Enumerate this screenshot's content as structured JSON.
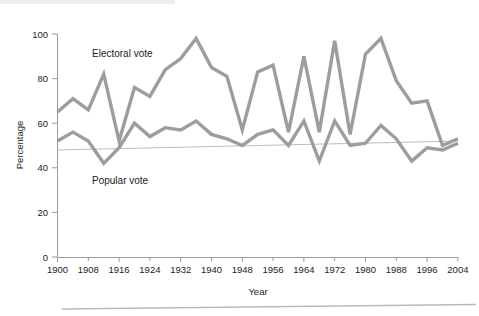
{
  "figure": {
    "background_color": "#ffffff",
    "series_color": "#9d9d9d",
    "axis_color": "#9a9a9a",
    "reference_line_color": "#b4b4b4",
    "electoral_label": "Electoral vote",
    "popular_label": "Popular vote"
  },
  "chart_data": {
    "type": "line",
    "title": "",
    "xlabel": "Year",
    "ylabel": "Percentage",
    "xlim": [
      1900,
      2004
    ],
    "ylim": [
      0,
      100
    ],
    "xticks": [
      1900,
      1908,
      1916,
      1924,
      1932,
      1940,
      1948,
      1956,
      1964,
      1972,
      1980,
      1988,
      1996,
      2004
    ],
    "xtick_labels": [
      "1900",
      "1908",
      "1916",
      "1924",
      "1932",
      "1940",
      "1948",
      "1956",
      "1964",
      "1972",
      "1980",
      "1988",
      "1996",
      "2004"
    ],
    "xtick_minor_step": 4,
    "yticks": [
      0,
      20,
      40,
      60,
      80,
      100
    ],
    "ytick_labels": [
      "0",
      "20",
      "40",
      "60",
      "80",
      "100"
    ],
    "grid": false,
    "legend": "inline-annotations",
    "x": [
      1900,
      1904,
      1908,
      1912,
      1916,
      1920,
      1924,
      1928,
      1932,
      1936,
      1940,
      1944,
      1948,
      1952,
      1956,
      1960,
      1964,
      1968,
      1972,
      1976,
      1980,
      1984,
      1988,
      1992,
      1996,
      2000,
      2004
    ],
    "series": [
      {
        "name": "Electoral vote",
        "values": [
          65,
          71,
          66,
          82,
          52,
          76,
          72,
          84,
          89,
          98,
          85,
          81,
          57,
          83,
          86,
          56,
          90,
          56,
          97,
          55,
          91,
          98,
          79,
          69,
          70,
          50,
          53
        ]
      },
      {
        "name": "Popular vote",
        "values": [
          52,
          56,
          52,
          42,
          49,
          60,
          54,
          58,
          57,
          61,
          55,
          53,
          50,
          55,
          57,
          50,
          61,
          43,
          61,
          50,
          51,
          59,
          53,
          43,
          49,
          48,
          51
        ]
      }
    ],
    "reference_line": {
      "name": "fifty-percent-trend",
      "x": [
        1900,
        2004
      ],
      "y": [
        48,
        52
      ]
    }
  }
}
